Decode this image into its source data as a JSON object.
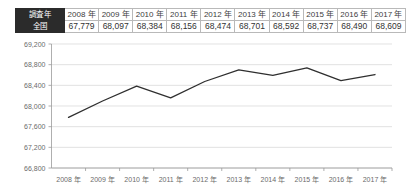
{
  "table": {
    "row_labels": {
      "header": "調査年",
      "series": "全国"
    },
    "columns": [
      "2008 年",
      "2009 年",
      "2010 年",
      "2011 年",
      "2012 年",
      "2013 年",
      "2014 年",
      "2015 年",
      "2016 年",
      "2017 年"
    ],
    "values": [
      "67,779",
      "68,097",
      "68,384",
      "68,156",
      "68,474",
      "68,701",
      "68,592",
      "68,737",
      "68,490",
      "68,609"
    ]
  },
  "chart_data": {
    "type": "line",
    "title": "",
    "xlabel": "",
    "ylabel": "",
    "categories": [
      "2008 年",
      "2009 年",
      "2010 年",
      "2011 年",
      "2012 年",
      "2013 年",
      "2014 年",
      "2015 年",
      "2016 年",
      "2017 年"
    ],
    "values": [
      67779,
      68097,
      68384,
      68156,
      68474,
      68701,
      68592,
      68737,
      68490,
      68609
    ],
    "series": [
      {
        "name": "全国",
        "values": [
          67779,
          68097,
          68384,
          68156,
          68474,
          68701,
          68592,
          68737,
          68490,
          68609
        ]
      }
    ],
    "ylim": [
      66800,
      69200
    ],
    "ytick_step": 400,
    "ytick_labels": [
      "69,200",
      "68,800",
      "68,400",
      "68,000",
      "67,600",
      "67,200",
      "66,800"
    ],
    "ytick_values": [
      69200,
      68800,
      68400,
      68000,
      67600,
      67200,
      66800
    ],
    "grid": true,
    "legend": "none",
    "line_color": "#2f2f2f",
    "grid_color": "#d6d6d6"
  },
  "colors": {
    "header_bg": "#2b2b2b",
    "header_text": "#ffffff",
    "table_border": "#b9b9b9",
    "line": "#2f2f2f",
    "grid": "#d6d6d6",
    "axis": "#9a9a9a",
    "tick_text": "#6b6b6b"
  }
}
